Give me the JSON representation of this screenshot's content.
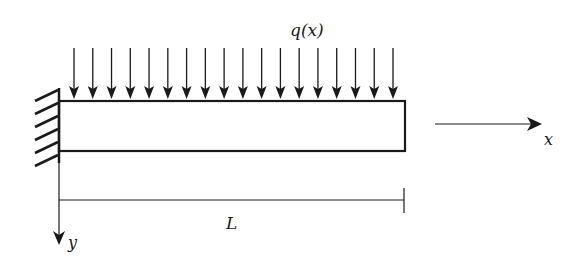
{
  "diagram": {
    "labels": {
      "load": "q(x)",
      "length": "L",
      "x_axis": "x",
      "y_axis": "y"
    },
    "load_arrow_count": 18,
    "colors": {
      "stroke": "#1a1a1a",
      "background": "#ffffff"
    }
  }
}
